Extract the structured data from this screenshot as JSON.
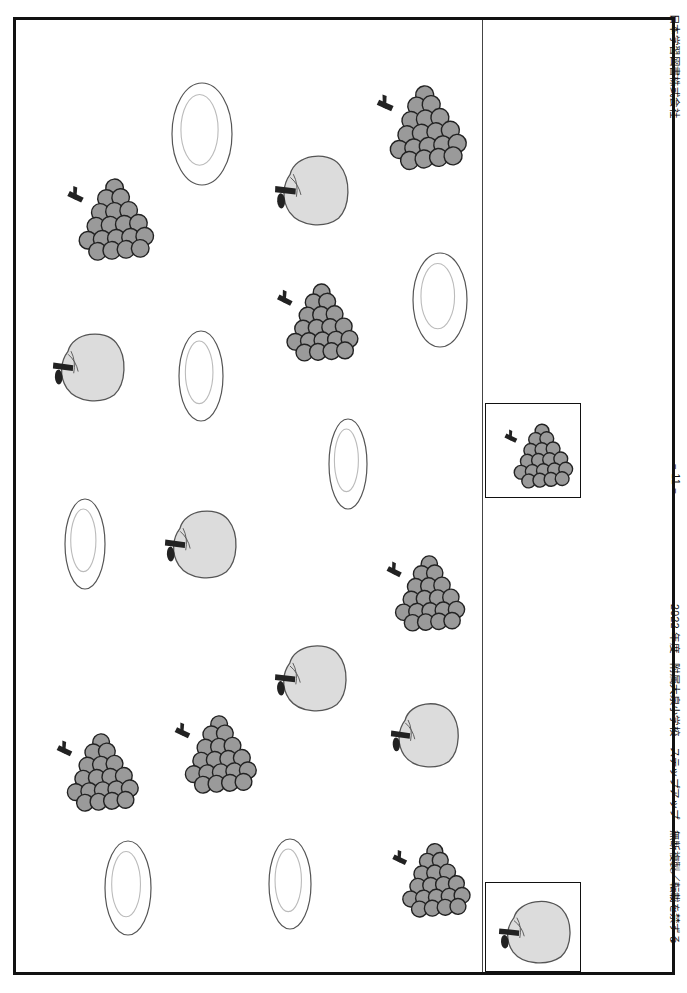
{
  "page": {
    "width": 687,
    "height": 993,
    "background_color": "#ffffff"
  },
  "logo": {
    "name": "publisher-logo-cut-off",
    "text": "ステ"
  },
  "margin_text": {
    "publisher": "日本学習図書株式会社",
    "page_number": "− 11 −",
    "copyright": "2022 年度　附属大泉小学校　ステップアップ　無断複製／転載を禁ずる"
  },
  "colors": {
    "frame": "#111111",
    "divider": "#444444",
    "grape_fill": "#9a9a9a",
    "grape_stroke": "#222222",
    "apple_fill": "#dcdcdc",
    "apple_stroke": "#555555",
    "stem_fill": "#222222",
    "plate_stroke": "#555555",
    "plate_inner_stroke": "#bbbbbb"
  },
  "worksheet": {
    "name": "counting-worksheet-canvas",
    "width": 466,
    "height": 952,
    "items": [
      {
        "id": "plate-1",
        "type": "plate",
        "x": 155,
        "y": 62,
        "w": 62,
        "h": 104,
        "rot": 0
      },
      {
        "id": "grapes-1",
        "type": "grapes",
        "x": 352,
        "y": 62,
        "w": 100,
        "h": 86,
        "rot": -6
      },
      {
        "id": "grapes-2",
        "type": "grapes",
        "x": 42,
        "y": 155,
        "w": 98,
        "h": 84,
        "rot": -4
      },
      {
        "id": "apple-1",
        "type": "apple",
        "x": 258,
        "y": 130,
        "w": 78,
        "h": 76,
        "rot": -4
      },
      {
        "id": "plate-2",
        "type": "plate",
        "x": 396,
        "y": 232,
        "w": 56,
        "h": 96,
        "rot": 0
      },
      {
        "id": "grapes-3",
        "type": "grapes",
        "x": 252,
        "y": 260,
        "w": 92,
        "h": 80,
        "rot": -3
      },
      {
        "id": "apple-2",
        "type": "apple",
        "x": 36,
        "y": 308,
        "w": 76,
        "h": 74,
        "rot": -3
      },
      {
        "id": "plate-3",
        "type": "plate",
        "x": 162,
        "y": 310,
        "w": 46,
        "h": 92,
        "rot": 0
      },
      {
        "id": "plate-4",
        "type": "plate",
        "x": 312,
        "y": 398,
        "w": 40,
        "h": 92,
        "rot": 0
      },
      {
        "id": "plate-5",
        "type": "plate",
        "x": 48,
        "y": 478,
        "w": 42,
        "h": 92,
        "rot": 0
      },
      {
        "id": "apple-3",
        "type": "apple",
        "x": 148,
        "y": 485,
        "w": 76,
        "h": 74,
        "rot": -3
      },
      {
        "id": "grapes-4",
        "type": "grapes",
        "x": 362,
        "y": 532,
        "w": 88,
        "h": 78,
        "rot": -3
      },
      {
        "id": "apple-4",
        "type": "apple",
        "x": 258,
        "y": 620,
        "w": 76,
        "h": 72,
        "rot": -4
      },
      {
        "id": "apple-5",
        "type": "apple",
        "x": 374,
        "y": 678,
        "w": 72,
        "h": 70,
        "rot": -3
      },
      {
        "id": "grapes-5",
        "type": "grapes",
        "x": 150,
        "y": 692,
        "w": 92,
        "h": 80,
        "rot": -4
      },
      {
        "id": "grapes-6",
        "type": "grapes",
        "x": 32,
        "y": 710,
        "w": 92,
        "h": 80,
        "rot": -4
      },
      {
        "id": "grapes-7",
        "type": "grapes",
        "x": 368,
        "y": 820,
        "w": 88,
        "h": 76,
        "rot": -4
      },
      {
        "id": "plate-6",
        "type": "plate",
        "x": 88,
        "y": 820,
        "w": 48,
        "h": 96,
        "rot": 0
      },
      {
        "id": "plate-7",
        "type": "plate",
        "x": 252,
        "y": 818,
        "w": 44,
        "h": 92,
        "rot": 0
      }
    ],
    "counts": {
      "grapes": 7,
      "apples": 5,
      "plates": 7
    }
  },
  "answer_column": {
    "name": "answer-key-column",
    "boxes": [
      {
        "id": "answer-box-grapes",
        "icon": "grapes-icon",
        "x": 2,
        "y": 383,
        "w": 96,
        "h": 95
      },
      {
        "id": "answer-box-apple",
        "icon": "apple-icon",
        "x": 2,
        "y": 862,
        "w": 96,
        "h": 90
      }
    ]
  }
}
